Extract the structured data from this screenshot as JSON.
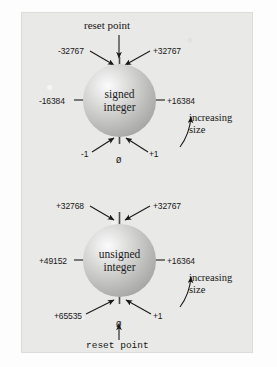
{
  "figure": {
    "background_color": "#e9e9e7",
    "page_color": "#fdfdfd",
    "ink_color": "#171717"
  },
  "diagrams": [
    {
      "id": "signed",
      "sphere_label_line1": "signed",
      "sphere_label_line2": "integer",
      "top_caption": "reset point",
      "top_left_value": "-32767",
      "top_right_value": "+32767",
      "left_value": "-16384",
      "right_value": "+16384",
      "bottom_left_value": "-1",
      "bottom_center_value": "Ø",
      "bottom_right_value": "+1",
      "annotation_line1": "increasing",
      "annotation_line2": "size"
    },
    {
      "id": "unsigned",
      "sphere_label_line1": "unsigned",
      "sphere_label_line2": "integer",
      "bottom_caption": "reset point",
      "top_left_value": "+32768",
      "top_right_value": "+32767",
      "left_value": "+49152",
      "right_value": "+16364",
      "bottom_left_value": "+65535",
      "bottom_center_value": "Ø",
      "bottom_right_value": "+1",
      "annotation_line1": "increasing",
      "annotation_line2": "size"
    }
  ]
}
